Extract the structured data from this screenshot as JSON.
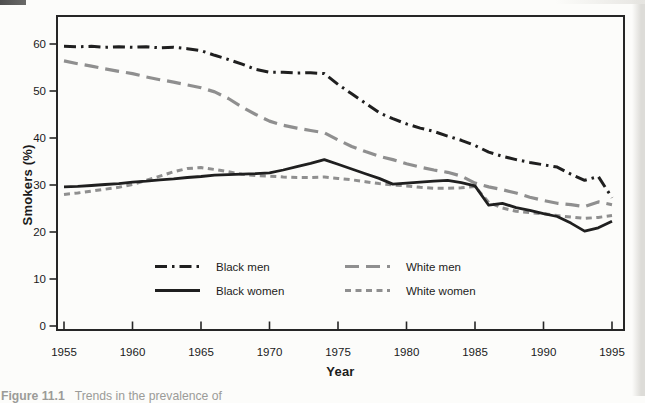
{
  "page": {
    "caption_label": "Figure 11.1",
    "caption_text": "Trends in the prevalence of"
  },
  "colors": {
    "black_line": "#1f1f1f",
    "gray_line": "#8f8f8f",
    "frame": "#262626"
  },
  "chart_data": {
    "type": "line",
    "title": "",
    "xlabel": "Year",
    "ylabel": "Smokers (%)",
    "xlim": [
      1955,
      1995
    ],
    "ylim": [
      0,
      60
    ],
    "x_ticks": [
      1955,
      1960,
      1965,
      1970,
      1975,
      1980,
      1985,
      1990,
      1995
    ],
    "y_ticks": [
      0,
      10,
      20,
      30,
      40,
      50,
      60
    ],
    "grid": false,
    "legend_position": "inside-bottom-center",
    "series": [
      {
        "name": "Black men",
        "color": "#1f1f1f",
        "dash": "12 5 2.5 5",
        "width": 3,
        "points": [
          [
            1955,
            59.5
          ],
          [
            1956,
            59.4
          ],
          [
            1957,
            59.5
          ],
          [
            1958,
            59.3
          ],
          [
            1959,
            59.4
          ],
          [
            1960,
            59.3
          ],
          [
            1961,
            59.4
          ],
          [
            1962,
            59.2
          ],
          [
            1963,
            59.3
          ],
          [
            1964,
            59.0
          ],
          [
            1965,
            58.6
          ],
          [
            1966,
            57.6
          ],
          [
            1967,
            56.7
          ],
          [
            1968,
            55.7
          ],
          [
            1969,
            54.6
          ],
          [
            1970,
            54.0
          ],
          [
            1971,
            54.0
          ],
          [
            1972,
            53.8
          ],
          [
            1973,
            53.9
          ],
          [
            1974,
            53.7
          ],
          [
            1975,
            51.4
          ],
          [
            1976,
            49.4
          ],
          [
            1977,
            47.4
          ],
          [
            1978,
            45.4
          ],
          [
            1979,
            44.1
          ],
          [
            1980,
            43.0
          ],
          [
            1981,
            42.1
          ],
          [
            1982,
            41.4
          ],
          [
            1983,
            40.4
          ],
          [
            1984,
            39.5
          ],
          [
            1985,
            38.4
          ],
          [
            1986,
            37.0
          ],
          [
            1987,
            36.1
          ],
          [
            1988,
            35.4
          ],
          [
            1989,
            34.8
          ],
          [
            1990,
            34.3
          ],
          [
            1991,
            33.8
          ],
          [
            1992,
            32.3
          ],
          [
            1993,
            31.0
          ],
          [
            1994,
            31.8
          ],
          [
            1995,
            27.3
          ]
        ]
      },
      {
        "name": "Black women",
        "color": "#1f1f1f",
        "dash": "",
        "width": 2.8,
        "points": [
          [
            1955,
            29.6
          ],
          [
            1956,
            29.7
          ],
          [
            1957,
            29.9
          ],
          [
            1958,
            30.1
          ],
          [
            1959,
            30.3
          ],
          [
            1960,
            30.6
          ],
          [
            1961,
            30.8
          ],
          [
            1962,
            31.1
          ],
          [
            1963,
            31.3
          ],
          [
            1964,
            31.6
          ],
          [
            1965,
            31.8
          ],
          [
            1966,
            32.1
          ],
          [
            1967,
            32.2
          ],
          [
            1968,
            32.3
          ],
          [
            1969,
            32.4
          ],
          [
            1970,
            32.6
          ],
          [
            1971,
            33.2
          ],
          [
            1972,
            33.9
          ],
          [
            1973,
            34.6
          ],
          [
            1974,
            35.4
          ],
          [
            1975,
            34.4
          ],
          [
            1976,
            33.4
          ],
          [
            1977,
            32.4
          ],
          [
            1978,
            31.4
          ],
          [
            1979,
            30.2
          ],
          [
            1980,
            30.4
          ],
          [
            1981,
            30.6
          ],
          [
            1982,
            30.8
          ],
          [
            1983,
            31.0
          ],
          [
            1984,
            30.5
          ],
          [
            1985,
            29.8
          ],
          [
            1986,
            25.7
          ],
          [
            1987,
            26.1
          ],
          [
            1988,
            25.2
          ],
          [
            1989,
            24.6
          ],
          [
            1990,
            23.9
          ],
          [
            1991,
            23.3
          ],
          [
            1992,
            21.9
          ],
          [
            1993,
            20.2
          ],
          [
            1994,
            20.9
          ],
          [
            1995,
            22.3
          ]
        ]
      },
      {
        "name": "White men",
        "color": "#8f8f8f",
        "dash": "14 7",
        "width": 3.2,
        "points": [
          [
            1955,
            56.4
          ],
          [
            1956,
            55.8
          ],
          [
            1957,
            55.3
          ],
          [
            1958,
            54.7
          ],
          [
            1959,
            54.2
          ],
          [
            1960,
            53.7
          ],
          [
            1961,
            53.0
          ],
          [
            1962,
            52.4
          ],
          [
            1963,
            51.9
          ],
          [
            1964,
            51.3
          ],
          [
            1965,
            50.7
          ],
          [
            1966,
            49.8
          ],
          [
            1967,
            48.4
          ],
          [
            1968,
            46.6
          ],
          [
            1969,
            45.0
          ],
          [
            1970,
            43.6
          ],
          [
            1971,
            42.7
          ],
          [
            1972,
            42.1
          ],
          [
            1973,
            41.6
          ],
          [
            1974,
            41.1
          ],
          [
            1975,
            39.6
          ],
          [
            1976,
            38.2
          ],
          [
            1977,
            37.1
          ],
          [
            1978,
            36.1
          ],
          [
            1979,
            35.4
          ],
          [
            1980,
            34.5
          ],
          [
            1981,
            33.8
          ],
          [
            1982,
            33.2
          ],
          [
            1983,
            32.7
          ],
          [
            1984,
            31.9
          ],
          [
            1985,
            30.4
          ],
          [
            1986,
            29.6
          ],
          [
            1987,
            29.0
          ],
          [
            1988,
            28.3
          ],
          [
            1989,
            27.4
          ],
          [
            1990,
            26.7
          ],
          [
            1991,
            26.1
          ],
          [
            1992,
            25.8
          ],
          [
            1993,
            25.4
          ],
          [
            1994,
            26.4
          ],
          [
            1995,
            25.8
          ]
        ]
      },
      {
        "name": "White women",
        "color": "#8f8f8f",
        "dash": "6 4.5",
        "width": 3,
        "points": [
          [
            1955,
            28.0
          ],
          [
            1956,
            28.3
          ],
          [
            1957,
            28.7
          ],
          [
            1958,
            29.1
          ],
          [
            1959,
            29.5
          ],
          [
            1960,
            30.1
          ],
          [
            1961,
            31.0
          ],
          [
            1962,
            31.9
          ],
          [
            1963,
            32.8
          ],
          [
            1964,
            33.5
          ],
          [
            1965,
            33.7
          ],
          [
            1966,
            33.3
          ],
          [
            1967,
            32.8
          ],
          [
            1968,
            32.3
          ],
          [
            1969,
            32.0
          ],
          [
            1970,
            31.9
          ],
          [
            1971,
            31.7
          ],
          [
            1972,
            31.6
          ],
          [
            1973,
            31.6
          ],
          [
            1974,
            31.7
          ],
          [
            1975,
            31.4
          ],
          [
            1976,
            31.1
          ],
          [
            1977,
            30.7
          ],
          [
            1978,
            30.3
          ],
          [
            1979,
            30.0
          ],
          [
            1980,
            29.8
          ],
          [
            1981,
            29.5
          ],
          [
            1982,
            29.3
          ],
          [
            1983,
            29.3
          ],
          [
            1984,
            29.4
          ],
          [
            1985,
            29.7
          ],
          [
            1986,
            26.3
          ],
          [
            1987,
            25.1
          ],
          [
            1988,
            24.4
          ],
          [
            1989,
            24.1
          ],
          [
            1990,
            23.9
          ],
          [
            1991,
            23.5
          ],
          [
            1992,
            23.2
          ],
          [
            1993,
            22.9
          ],
          [
            1994,
            23.1
          ],
          [
            1995,
            23.5
          ]
        ]
      }
    ]
  }
}
